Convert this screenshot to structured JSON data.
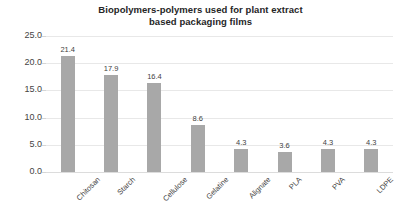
{
  "chart_data": {
    "type": "bar",
    "title": "Biopolymers-polymers used for plant extract\nbased packaging films",
    "xlabel": "",
    "ylabel": "",
    "categories": [
      "Chitosan",
      "Starch",
      "Cellulose",
      "Gelatine",
      "Alignate",
      "PLA",
      "PVA",
      "LDPE"
    ],
    "values": [
      21.4,
      17.9,
      16.4,
      8.6,
      4.3,
      3.6,
      4.3,
      4.3
    ],
    "value_labels": [
      "21.4",
      "17.9",
      "16.4",
      "8.6",
      "4.3",
      "3.6",
      "4.3",
      "4.3"
    ],
    "ylim": [
      0.0,
      25.0
    ],
    "ytick_values": [
      0.0,
      5.0,
      10.0,
      15.0,
      20.0,
      25.0
    ],
    "ytick_labels": [
      "0.0",
      "5.0",
      "10.0",
      "15.0",
      "20.0",
      "25.0"
    ],
    "grid": true,
    "legend": false,
    "bar_color": "#a8a8a8",
    "gridline_color": "#e8e8e8",
    "background_color": "#ffffff",
    "title_color": "#262626",
    "label_rotation_degrees": -45
  }
}
